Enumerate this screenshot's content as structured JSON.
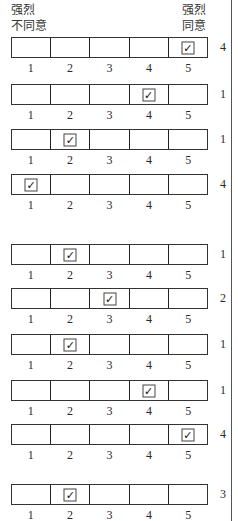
{
  "header": {
    "left_label_line1": "强烈",
    "left_label_line2": "不同意",
    "right_label_line1": "强烈",
    "right_label_line2": "同意"
  },
  "scale": [
    "1",
    "2",
    "3",
    "4",
    "5"
  ],
  "check_glyph": "✓",
  "rows": [
    {
      "top": 37,
      "checked": 5,
      "score": "4"
    },
    {
      "top": 84,
      "checked": 4,
      "score": "1"
    },
    {
      "top": 129,
      "checked": 2,
      "score": "1"
    },
    {
      "top": 174,
      "checked": 1,
      "score": "4"
    },
    {
      "top": 244,
      "checked": 2,
      "score": "1"
    },
    {
      "top": 288,
      "checked": 3,
      "score": "2"
    },
    {
      "top": 334,
      "checked": 2,
      "score": "1"
    },
    {
      "top": 380,
      "checked": 4,
      "score": "1"
    },
    {
      "top": 424,
      "checked": 5,
      "score": "4"
    },
    {
      "top": 484,
      "checked": 2,
      "score": "3"
    }
  ]
}
